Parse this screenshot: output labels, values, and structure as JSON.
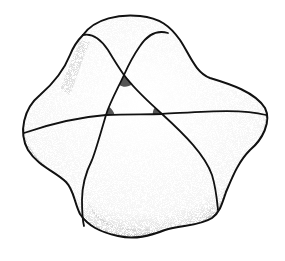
{
  "figure": {
    "colors": {
      "stroke": "#111111",
      "angle_fill": "#555555",
      "stipple": "#7a7a7a",
      "background": "#ffffff"
    },
    "triangle": {
      "vertices": [
        {
          "name": "top",
          "x": 124,
          "y": 75
        },
        {
          "name": "bottom-left",
          "x": 106,
          "y": 115
        },
        {
          "name": "bottom-right",
          "x": 162,
          "y": 114
        }
      ],
      "shaded_angles": 3
    },
    "curves": 3
  }
}
